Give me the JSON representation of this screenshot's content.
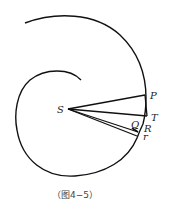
{
  "figure": {
    "caption": "（图4−5）",
    "labels": {
      "S": "S",
      "P": "P",
      "T": "T",
      "Q": "Q",
      "R": "R",
      "r": "r"
    },
    "colors": {
      "stroke": "#111111",
      "background": "#ffffff"
    }
  }
}
